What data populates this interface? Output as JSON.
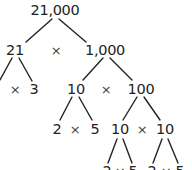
{
  "diagram": {
    "type": "factor-tree",
    "root": "21,000",
    "level1": {
      "left": "21",
      "op": "×",
      "right": "1,000"
    },
    "level2_left": {
      "left": "7",
      "op": "×",
      "right": "3"
    },
    "level2_right": {
      "left": "10",
      "op": "×",
      "right": "100"
    },
    "level3_left": {
      "left": "2",
      "op": "×",
      "right": "5"
    },
    "level3_right": {
      "left": "10",
      "op": "×",
      "right": "10"
    },
    "level4_a": {
      "left": "2",
      "op": "×",
      "right": "5"
    },
    "level4_b": {
      "left": "2",
      "op": "×",
      "right": "5"
    }
  },
  "colors": {
    "text": "#222222",
    "lines": "#222222",
    "background": "#ffffff"
  }
}
